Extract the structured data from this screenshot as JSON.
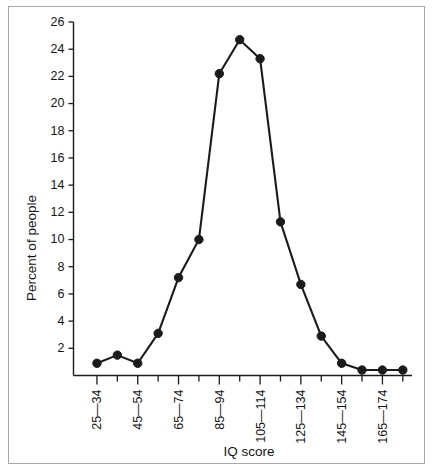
{
  "chart_data": {
    "type": "line",
    "title": "",
    "xlabel": "IQ score",
    "ylabel": "Percent of people",
    "ylim": [
      0,
      26
    ],
    "yticks": [
      2,
      4,
      6,
      8,
      10,
      12,
      14,
      16,
      18,
      20,
      22,
      24,
      26
    ],
    "ytick_labels": [
      "2",
      "4",
      "6",
      "8",
      "10",
      "12",
      "14",
      "16",
      "18",
      "20",
      "22",
      "24",
      "26"
    ],
    "grid": false,
    "legend": "none",
    "marker": "filled-circle",
    "line_color": "#1b1b1b",
    "categories": [
      "25—34",
      "35—44",
      "45—54",
      "55—64",
      "65—74",
      "75—84",
      "85—94",
      "95—104",
      "105—114",
      "115—124",
      "125—134",
      "135—144",
      "145—154",
      "155—164",
      "165—174",
      "175—184"
    ],
    "xtick_labels_visible": [
      "25—34",
      "",
      "45—54",
      "",
      "65—74",
      "",
      "85—94",
      "",
      "105—114",
      "",
      "125—134",
      "",
      "145—154",
      "",
      "165—174",
      ""
    ],
    "values": [
      0.9,
      1.5,
      0.9,
      3.1,
      7.2,
      10.0,
      22.2,
      24.7,
      23.3,
      11.3,
      6.7,
      2.9,
      0.9,
      0.4,
      0.4,
      0.4
    ],
    "values_note": "Percent of people per IQ score band"
  },
  "figure": {
    "ylabel": "Percent of people",
    "xlabel": "IQ score"
  }
}
